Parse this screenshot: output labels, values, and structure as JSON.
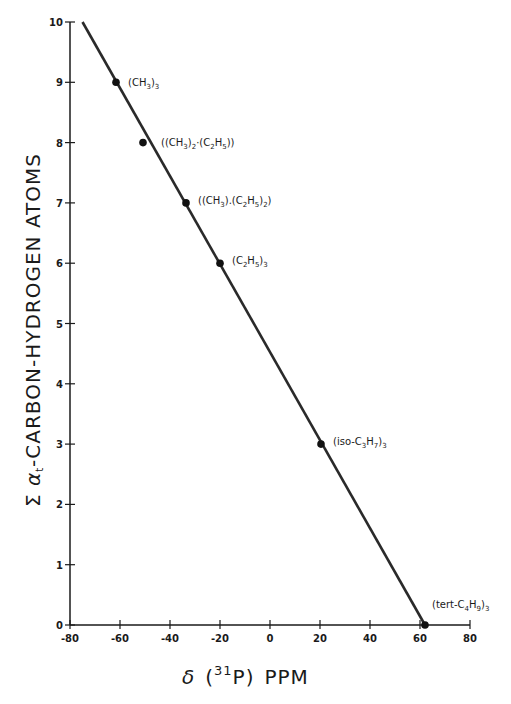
{
  "chart_data": {
    "type": "scatter",
    "title": "",
    "xlabel": "δ (31P) PPM",
    "xlabel_parts": {
      "delta": "δ",
      "open": "(",
      "sup": "31",
      "element": "P)",
      "unit": "PPM"
    },
    "ylabel": "Σ α-CARBON-HYDROGEN ATOMS",
    "xlim": [
      -80,
      80
    ],
    "ylim": [
      0,
      10
    ],
    "x_ticks": [
      -80,
      -60,
      -40,
      -20,
      0,
      20,
      40,
      60,
      80
    ],
    "y_ticks": [
      0,
      1,
      2,
      3,
      4,
      5,
      6,
      7,
      8,
      9,
      10
    ],
    "grid": false,
    "legend": null,
    "series": [
      {
        "name": "trialkylphosphines",
        "points": [
          {
            "label": "(CH3)3",
            "x": -62,
            "y": 9
          },
          {
            "label": "((CH3)2.(C2H5))",
            "x": -51,
            "y": 8
          },
          {
            "label": "((CH3).(C2H5)2)",
            "x": -34,
            "y": 7
          },
          {
            "label": "(C2H5)3",
            "x": -20,
            "y": 6
          },
          {
            "label": "(iso-C3H7)3",
            "x": 20,
            "y": 3
          },
          {
            "label": "(tert-C4H9)3",
            "x": 62,
            "y": 0
          }
        ]
      }
    ],
    "fit_line": {
      "x_start": -75,
      "y_start": 10,
      "x_end": 62,
      "y_end": 0
    }
  },
  "annotations": [
    {
      "id": "p1",
      "main": "(CH",
      "sub1": "3",
      "rest": ")",
      "sub2": "3"
    },
    {
      "id": "p2",
      "text": "((CH3)2·(C2H5))"
    },
    {
      "id": "p3",
      "text": "((CH3).(C2H5)2)"
    },
    {
      "id": "p4",
      "text": "(C2H5)3"
    },
    {
      "id": "p5",
      "text": "(iso-C3H7)3"
    },
    {
      "id": "p6",
      "text": "(tert-C4H9)3"
    }
  ]
}
